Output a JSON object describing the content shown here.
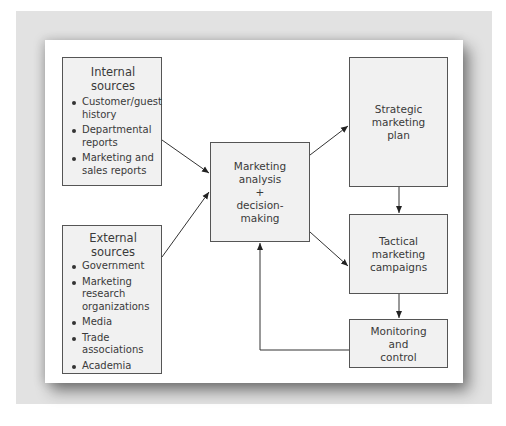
{
  "diagram": {
    "internal_sources": {
      "title": "Internal sources",
      "items": [
        "Customer/guest history",
        "Departmental reports",
        "Marketing and sales reports"
      ]
    },
    "external_sources": {
      "title": "External sources",
      "items": [
        "Government",
        "Marketing research organizations",
        "Media",
        "Trade associations",
        "Academia"
      ]
    },
    "center": {
      "line1": "Marketing",
      "line2": "analysis",
      "line3": "+",
      "line4": "decision-",
      "line5": "making"
    },
    "strategic": {
      "line1": "Strategic",
      "line2": "marketing",
      "line3": "plan"
    },
    "tactical": {
      "line1": "Tactical",
      "line2": "marketing",
      "line3": "campaigns"
    },
    "monitoring": {
      "line1": "Monitoring",
      "line2": "and",
      "line3": "control"
    },
    "edges": [
      {
        "from": "Internal sources",
        "to": "Marketing analysis + decision-making"
      },
      {
        "from": "External sources",
        "to": "Marketing analysis + decision-making"
      },
      {
        "from": "Marketing analysis + decision-making",
        "to": "Strategic marketing plan"
      },
      {
        "from": "Marketing analysis + decision-making",
        "to": "Tactical marketing campaigns"
      },
      {
        "from": "Strategic marketing plan",
        "to": "Tactical marketing campaigns"
      },
      {
        "from": "Tactical marketing campaigns",
        "to": "Monitoring and control"
      },
      {
        "from": "Monitoring and control",
        "to": "Marketing analysis + decision-making"
      }
    ],
    "colors": {
      "box_fill": "#f1f1f1",
      "border": "#555555",
      "frame": "#e2e2e2",
      "text": "#3a3a3a"
    }
  }
}
